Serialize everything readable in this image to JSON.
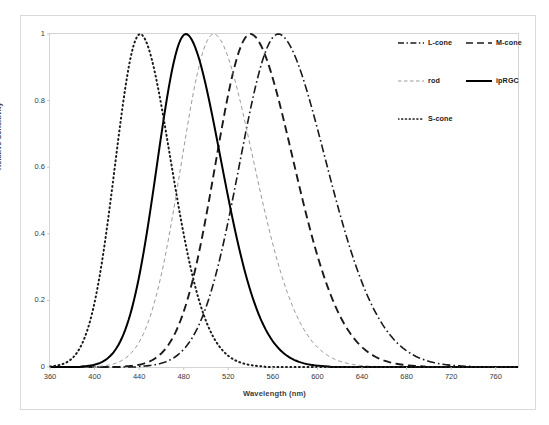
{
  "chart_data": {
    "type": "line",
    "title": "",
    "xlabel": "Wavelength (nm)",
    "ylabel": "Relative Sensitivity",
    "xlim": [
      360,
      780
    ],
    "ylim": [
      0,
      1
    ],
    "xticks": [
      360,
      400,
      440,
      480,
      520,
      560,
      600,
      640,
      680,
      720,
      760
    ],
    "yticks": [
      "0",
      "0.2",
      "0.4",
      "0.6",
      "0.8",
      "1"
    ],
    "grid": false,
    "legend_position": "top-right",
    "series": [
      {
        "name": "L-cone",
        "peak_nm": 565,
        "width_nm": 62,
        "style": "dash-dot",
        "color": "#1a1a1a",
        "legend_key": "l-cone"
      },
      {
        "name": "M-cone",
        "peak_nm": 540,
        "width_nm": 56,
        "style": "dashed",
        "color": "#1a1a1a",
        "legend_key": "m-cone"
      },
      {
        "name": "rod",
        "peak_nm": 507,
        "width_nm": 52,
        "style": "dashed-thin",
        "color": "#9a9a9a",
        "legend_key": "rod"
      },
      {
        "name": "ipRGC",
        "peak_nm": 482,
        "width_nm": 46,
        "style": "solid",
        "color": "#000000",
        "legend_key": "iprgc"
      },
      {
        "name": "S-cone",
        "peak_nm": 441,
        "width_nm": 40,
        "style": "dotted",
        "color": "#1a1a1a",
        "legend_key": "s-cone"
      }
    ]
  },
  "legend": {
    "entries": [
      {
        "label": "L-cone"
      },
      {
        "label": "M-cone"
      },
      {
        "label": "rod"
      },
      {
        "label": "ipRGC"
      },
      {
        "label": "S-cone"
      }
    ]
  },
  "axes": {
    "x_title": "Wavelength (nm)",
    "y_title": "Relative Sensitivity",
    "x_ticks": [
      "360",
      "400",
      "440",
      "480",
      "520",
      "560",
      "600",
      "640",
      "680",
      "720",
      "760"
    ],
    "y_ticks": [
      "1",
      "0.8",
      "0.6",
      "0.4",
      "0.2",
      "0"
    ]
  }
}
